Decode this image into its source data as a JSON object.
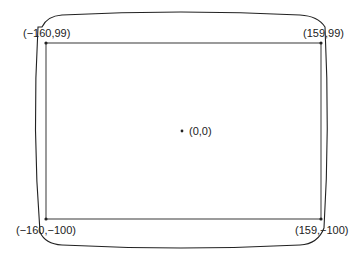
{
  "diagram": {
    "colors": {
      "stroke": "#222222",
      "background": "#ffffff"
    },
    "origin_label": "(0,0)",
    "corners": [
      {
        "id": "top-left",
        "label": "(−160,99)",
        "x": -160,
        "y": 99
      },
      {
        "id": "top-right",
        "label": "(159,99)",
        "x": 159,
        "y": 99
      },
      {
        "id": "bottom-left",
        "label": "(−160,−100)",
        "x": -160,
        "y": -100
      },
      {
        "id": "bottom-right",
        "label": "(159,−100)",
        "x": 159,
        "y": -100
      }
    ]
  }
}
